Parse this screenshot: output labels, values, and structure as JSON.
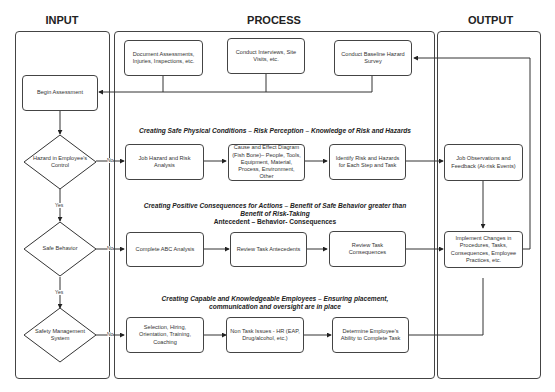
{
  "columns": {
    "input": "INPUT",
    "process": "PROCESS",
    "output": "OUTPUT"
  },
  "process_top": [
    {
      "id": "doc",
      "label": "Document Assessments, Injuries, Inspections, etc."
    },
    {
      "id": "interviews",
      "label": "Conduct Interviews, Site Visits, etc."
    },
    {
      "id": "baseline",
      "label": "Conduct Baseline Hazard Survey"
    }
  ],
  "input": {
    "begin": "Begin Assessment",
    "decisions": [
      {
        "label": "Hazard in Employee's Control"
      },
      {
        "label": "Safe Behavior"
      },
      {
        "label": "Safety Management System"
      }
    ],
    "yes_label": "Yes",
    "no_label": "No"
  },
  "sections": [
    {
      "heading": "Creating Safe Physical Conditions – Risk Perception – Knowledge of Risk and Hazards",
      "steps": [
        "Job Hazard and Risk Analysis",
        "Cause and Effect Diagram (Fish Bone)– People, Tools, Equipment, Material, Process, Environment, Other",
        "Identify Risk and Hazards for Each Step and Task"
      ]
    },
    {
      "heading_line1": "Creating Positive Consequences for Actions – Benefit of Safe Behavior greater than",
      "heading_line2": "Benefit of Risk-Taking",
      "heading_line3": "Antecedent – Behavior- Consequences",
      "steps": [
        "Complete ABC Analysis",
        "Review Task Antecedents",
        "Review Task Consequences"
      ]
    },
    {
      "heading_line1": "Creating Capable and Knowledgeable Employees – Ensuring placement,",
      "heading_line2": "communication and oversight are in place",
      "steps": [
        "Selection, Hiring, Orientation, Training, Coaching",
        "Non Task Issues - HR (EAP, Drug/alcohol, etc.)",
        "Determine Employee's Ability to Complete Task"
      ]
    }
  ],
  "output": {
    "observations": "Job Observations and Feedback (At-risk Events)",
    "implement": "Implement Changes in Procedures, Tasks, Consequences, Employee Practices, etc."
  }
}
